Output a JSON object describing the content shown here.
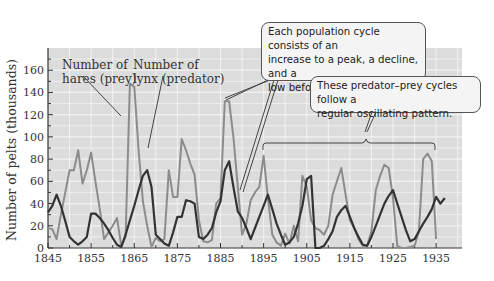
{
  "chart_data": {
    "type": "line",
    "title": "",
    "xlabel": "",
    "ylabel": "Number of pelts (thousands)",
    "xlim": [
      1845,
      1941
    ],
    "ylim": [
      0,
      180
    ],
    "grid": true,
    "x_ticks": [
      "1845",
      "1855",
      "1865",
      "1875",
      "1885",
      "1895",
      "1905",
      "1915",
      "1925",
      "1935"
    ],
    "y_ticks": [
      "0",
      "20",
      "40",
      "60",
      "80",
      "100",
      "120",
      "140",
      "160"
    ],
    "series": [
      {
        "name": "Number of hares (prey)",
        "color": "#8c8c8c",
        "x": [
          1845,
          1846,
          1847,
          1848,
          1849,
          1850,
          1851,
          1852,
          1853,
          1854,
          1855,
          1856,
          1857,
          1858,
          1859,
          1860,
          1861,
          1862,
          1863,
          1864,
          1865,
          1866,
          1867,
          1868,
          1869,
          1870,
          1871,
          1872,
          1873,
          1874,
          1875,
          1876,
          1877,
          1878,
          1879,
          1880,
          1881,
          1882,
          1883,
          1884,
          1885,
          1886,
          1887,
          1888,
          1889,
          1890,
          1891,
          1892,
          1893,
          1894,
          1895,
          1896,
          1897,
          1898,
          1899,
          1900,
          1901,
          1902,
          1903,
          1904,
          1905,
          1906,
          1907,
          1908,
          1909,
          1910,
          1911,
          1912,
          1913,
          1914,
          1915,
          1916,
          1917,
          1918,
          1919,
          1920,
          1921,
          1922,
          1923,
          1924,
          1925,
          1926,
          1927,
          1928,
          1929,
          1930,
          1931,
          1932,
          1933,
          1934,
          1935
        ],
        "values": [
          18,
          17,
          8,
          30,
          50,
          70,
          70,
          88,
          58,
          70,
          86,
          60,
          35,
          8,
          14,
          20,
          27,
          2,
          10,
          148,
          145,
          88,
          42,
          20,
          1,
          9,
          6,
          8,
          70,
          46,
          46,
          98,
          88,
          76,
          66,
          25,
          6,
          5,
          7,
          40,
          45,
          132,
          132,
          100,
          55,
          12,
          22,
          43,
          50,
          55,
          83,
          45,
          12,
          5,
          2,
          13,
          4,
          20,
          6,
          65,
          55,
          25,
          18,
          16,
          12,
          20,
          48,
          60,
          72,
          48,
          25,
          18,
          8,
          2,
          2,
          15,
          52,
          65,
          75,
          72,
          45,
          2,
          0,
          0,
          1,
          2,
          15,
          80,
          85,
          78,
          8
        ]
      },
      {
        "name": "Number of lynx (predator)",
        "color": "#333333",
        "x": [
          1845,
          1846,
          1847,
          1848,
          1849,
          1850,
          1851,
          1852,
          1853,
          1854,
          1855,
          1856,
          1857,
          1858,
          1859,
          1860,
          1861,
          1862,
          1863,
          1864,
          1865,
          1866,
          1867,
          1868,
          1869,
          1870,
          1871,
          1872,
          1873,
          1874,
          1875,
          1876,
          1877,
          1878,
          1879,
          1880,
          1881,
          1882,
          1883,
          1884,
          1885,
          1886,
          1887,
          1888,
          1889,
          1890,
          1891,
          1892,
          1893,
          1894,
          1895,
          1896,
          1897,
          1898,
          1899,
          1900,
          1901,
          1902,
          1903,
          1904,
          1905,
          1906,
          1907,
          1908,
          1909,
          1910,
          1911,
          1912,
          1913,
          1914,
          1915,
          1916,
          1917,
          1918,
          1919,
          1920,
          1921,
          1922,
          1923,
          1924,
          1925,
          1926,
          1927,
          1928,
          1929,
          1930,
          1931,
          1932,
          1933,
          1934,
          1935,
          1936,
          1937
        ],
        "values": [
          32,
          38,
          48,
          38,
          24,
          10,
          6,
          3,
          6,
          10,
          31,
          31,
          27,
          22,
          16,
          9,
          3,
          1,
          12,
          25,
          38,
          52,
          65,
          70,
          55,
          12,
          8,
          4,
          2,
          14,
          28,
          28,
          43,
          42,
          40,
          10,
          8,
          12,
          18,
          32,
          42,
          70,
          78,
          55,
          33,
          27,
          18,
          8,
          18,
          28,
          38,
          48,
          35,
          22,
          12,
          3,
          5,
          10,
          22,
          38,
          62,
          65,
          0,
          0,
          2,
          8,
          15,
          28,
          34,
          38,
          28,
          18,
          10,
          3,
          2,
          10,
          20,
          30,
          40,
          47,
          52,
          40,
          28,
          16,
          6,
          8,
          15,
          22,
          28,
          35,
          46,
          40,
          45
        ]
      }
    ],
    "annotations": [
      {
        "text_lines": [
          "Number of",
          "hares (prey)"
        ]
      },
      {
        "text_lines": [
          "Number of",
          "lynx (predator)"
        ]
      },
      {
        "text_lines": [
          "Each population cycle consists of an",
          "increase to a peak, a decline, and a",
          "low before another increase."
        ]
      },
      {
        "text_lines": [
          "These predator–prey cycles follow a",
          "regular oscillating pattern."
        ]
      }
    ]
  }
}
